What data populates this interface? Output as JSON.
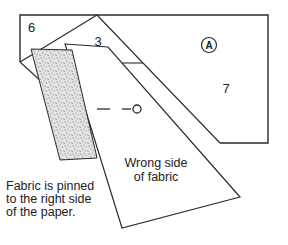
{
  "paper": {
    "unit_label": "A",
    "section_labels": {
      "six": "6",
      "three": "3",
      "seven": "7"
    }
  },
  "fabric": {
    "label_line1": "Wrong side",
    "label_line2": "of fabric"
  },
  "caption": {
    "line1": "Fabric is pinned",
    "line2": "to the right side",
    "line3": "of the paper."
  },
  "colors": {
    "background": "#ffffff",
    "line": "#2a2a2a",
    "text": "#222222",
    "stipple_base": "#e4e4e4",
    "stipple_dot": "#8c8c8c"
  }
}
